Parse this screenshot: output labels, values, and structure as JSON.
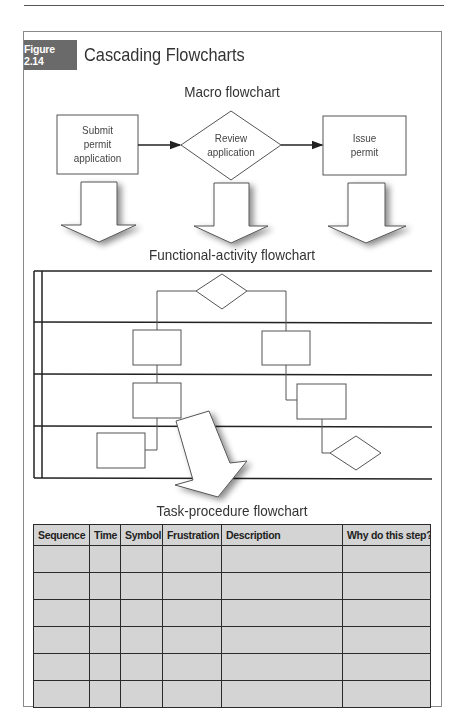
{
  "figure": {
    "number_label": "Figure 2.14",
    "title": "Cascading Flowcharts"
  },
  "macro": {
    "title": "Macro flowchart",
    "nodes": [
      {
        "shape": "process",
        "label_lines": [
          "Submit",
          "permit",
          "application"
        ]
      },
      {
        "shape": "decision",
        "label_lines": [
          "Review",
          "application"
        ]
      },
      {
        "shape": "process",
        "label_lines": [
          "Issue",
          "permit"
        ]
      }
    ]
  },
  "functional": {
    "title": "Functional-activity flowchart",
    "lanes": 4
  },
  "task": {
    "title": "Task-procedure flowchart",
    "columns": [
      "Sequence",
      "Time",
      "Symbol",
      "Frustration",
      "Description",
      "Why do this step?"
    ],
    "rows": [
      [
        "",
        "",
        "",
        "",
        "",
        ""
      ],
      [
        "",
        "",
        "",
        "",
        "",
        ""
      ],
      [
        "",
        "",
        "",
        "",
        "",
        ""
      ],
      [
        "",
        "",
        "",
        "",
        "",
        ""
      ],
      [
        "",
        "",
        "",
        "",
        "",
        ""
      ],
      [
        "",
        "",
        "",
        "",
        "",
        ""
      ]
    ]
  },
  "colors": {
    "badge": "#6a6a6a",
    "table_fill": "#d4d4d4",
    "line": "#333333"
  }
}
